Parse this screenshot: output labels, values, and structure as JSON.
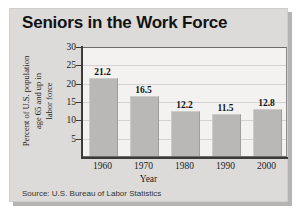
{
  "card": {
    "title": "Seniors in the Work Force",
    "source": "Source: U.S. Bureau of Labor Statistics"
  },
  "chart_data": {
    "type": "bar",
    "title": "Seniors in the Work Force",
    "categories": [
      "1960",
      "1970",
      "1980",
      "1990",
      "2000"
    ],
    "values": [
      21.2,
      16.5,
      12.2,
      11.5,
      12.8
    ],
    "value_labels": [
      "21.2",
      "16.5",
      "12.2",
      "11.5",
      "12.8"
    ],
    "xlabel": "Year",
    "ylabel": "Percent of U.S. population age 65 and up in labor force",
    "ylabel_lines": [
      "Percent of U.S. population",
      "age 65 and up in",
      "labor force"
    ],
    "ylim": [
      0,
      30
    ],
    "yticks": [
      30,
      25,
      20,
      15,
      10,
      5
    ],
    "ytick_labels": [
      "30",
      "25",
      "20",
      "15",
      "10",
      "5"
    ],
    "grid": true,
    "legend": null,
    "source": "Source: U.S. Bureau of Labor Statistics",
    "colors": {
      "bar_fill": "#b9b8b6",
      "plot_background": "#f3f2f1",
      "card_background": "#dcdbd9",
      "axis": "#3b3a38",
      "text": "#1b1b1b"
    }
  }
}
